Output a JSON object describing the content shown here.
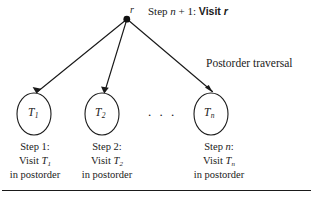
{
  "figure": {
    "background_color": "#ffffff",
    "ink_color": "#1a1a1a",
    "root": {
      "label": "r",
      "annotation_prefix": "Step ",
      "annotation_var": "n",
      "annotation_suffix": " + 1:",
      "annotation_action": "Visit ",
      "annotation_action_var": "r"
    },
    "traversal_caption": "Postorder traversal",
    "ellipsis": ". . .",
    "subtrees": [
      {
        "name": "T",
        "sub": "1",
        "step_line": "Step 1:",
        "visit_line": "Visit ",
        "visit_name": "T",
        "visit_sub": "1",
        "order_line": "in postorder"
      },
      {
        "name": "T",
        "sub": "2",
        "step_line": "Step 2:",
        "visit_line": "Visit ",
        "visit_name": "T",
        "visit_sub": "2",
        "order_line": "in postorder"
      },
      {
        "name": "T",
        "sub": "n",
        "step_line_prefix": "Step ",
        "step_line_var": "n",
        "step_line_suffix": ":",
        "visit_line": "Visit ",
        "visit_name": "T",
        "visit_sub": "n",
        "order_line": "in postorder"
      }
    ],
    "bottom_rule": true
  }
}
